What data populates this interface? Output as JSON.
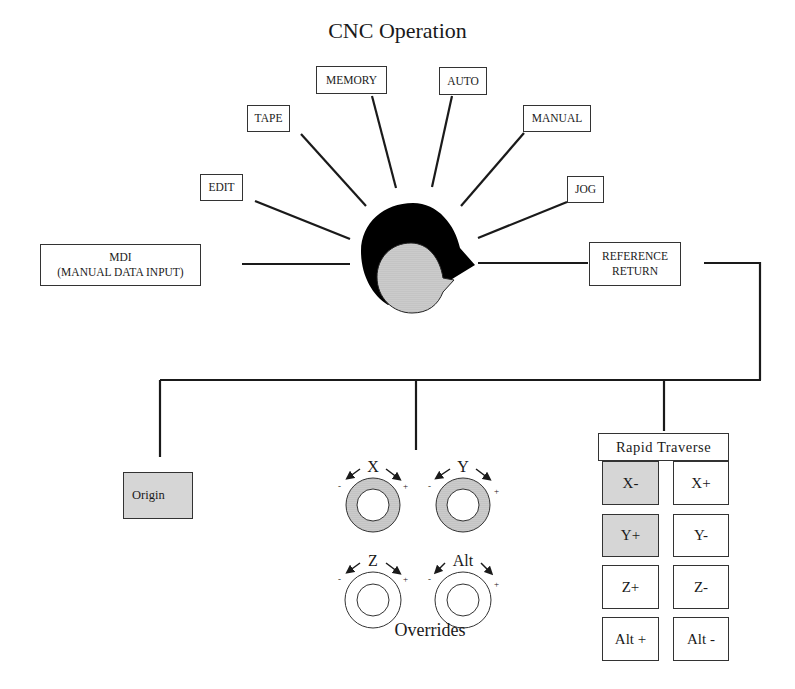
{
  "title": "CNC Operation",
  "mode_selector": {
    "modes": [
      {
        "id": "mdi",
        "line1": "MDI",
        "line2": "(MANUAL DATA INPUT)"
      },
      {
        "id": "edit",
        "label": "EDIT"
      },
      {
        "id": "tape",
        "label": "TAPE"
      },
      {
        "id": "memory",
        "label": "MEMORY"
      },
      {
        "id": "auto",
        "label": "AUTO"
      },
      {
        "id": "manual",
        "label": "MANUAL"
      },
      {
        "id": "jog",
        "label": "JOG"
      },
      {
        "id": "reference_return",
        "line1": "REFERENCE",
        "line2": "RETURN"
      }
    ],
    "selected": "reference_return"
  },
  "origin": {
    "label": "Origin"
  },
  "overrides": {
    "label": "Overrides",
    "dials": [
      {
        "axis": "X",
        "minus": "-",
        "plus": "+",
        "shaded": true
      },
      {
        "axis": "Y",
        "minus": "-",
        "plus": "+",
        "shaded": true
      },
      {
        "axis": "Z",
        "minus": "-",
        "plus": "+",
        "shaded": false
      },
      {
        "axis": "Alt",
        "minus": "-",
        "plus": "+",
        "shaded": false
      }
    ]
  },
  "rapid_traverse": {
    "title": "Rapid Traverse",
    "buttons": [
      {
        "label": "X-",
        "shaded": true
      },
      {
        "label": "X+",
        "shaded": false
      },
      {
        "label": "Y+",
        "shaded": true
      },
      {
        "label": "Y-",
        "shaded": false
      },
      {
        "label": "Z+",
        "shaded": false
      },
      {
        "label": "Z-",
        "shaded": false
      },
      {
        "label": "Alt +",
        "shaded": false
      },
      {
        "label": "Alt -",
        "shaded": false
      }
    ]
  },
  "colors": {
    "line": "#1a1a1a",
    "shade": "#d6d6d6",
    "knob": "#000000"
  }
}
